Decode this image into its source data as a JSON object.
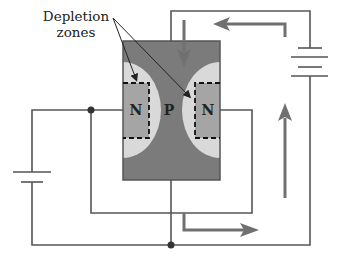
{
  "labels": {
    "depletion_line1": "Depletion",
    "depletion_line2": "zones",
    "n_left": "N",
    "p_center": "P",
    "n_right": "N"
  },
  "colors": {
    "p_region": "#7b7b7b",
    "depletion": "#d9d9d9",
    "n_region": "#a5a5a5",
    "wire": "#555555",
    "arrow": "#707070",
    "text": "#222222"
  },
  "components": {
    "transistor": "JFET (N-P-N regions with depletion zones)",
    "batteries": 2,
    "junctions": 2,
    "current_arrows": 4
  }
}
